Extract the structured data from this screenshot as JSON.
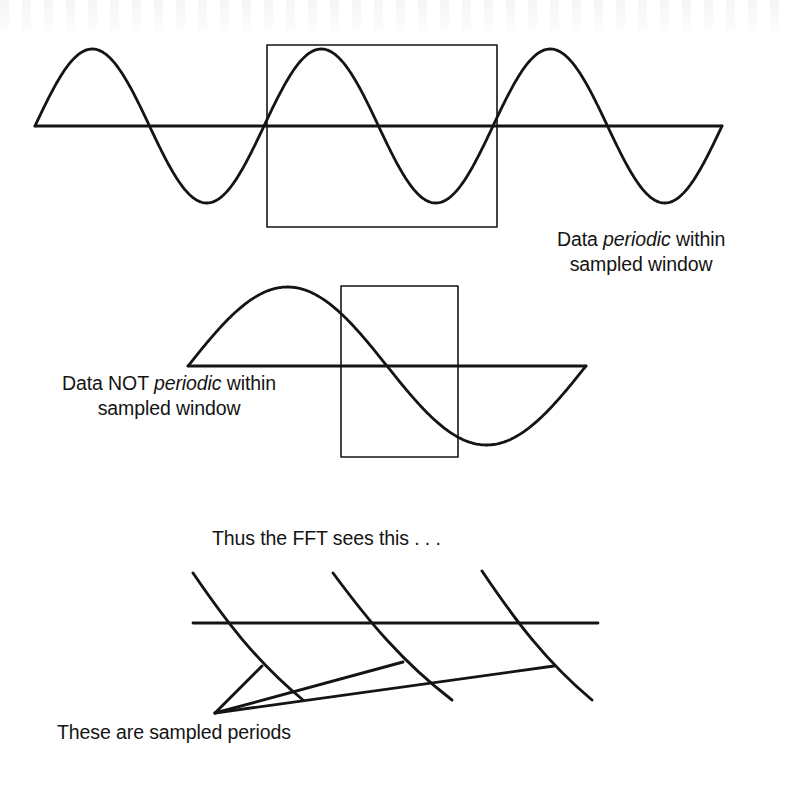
{
  "figure": {
    "kind": "line-diagram",
    "background_color": "#ffffff",
    "ink_color": "#141414",
    "width": 789,
    "height": 786
  },
  "captions": {
    "periodic": {
      "line1_prefix": "Data ",
      "line1_emphasis": "periodic",
      "line1_suffix": " within",
      "line2": "sampled window"
    },
    "not_periodic": {
      "line1_prefix": "Data NOT ",
      "line1_emphasis": "periodic",
      "line1_suffix": " within",
      "line2": "sampled window"
    },
    "thus": "Thus the FFT sees this . . .",
    "sampled_periods": "These are sampled periods"
  },
  "chart_data": {
    "type": "line",
    "title": "",
    "panels": [
      {
        "name": "periodic-panel",
        "description": "Sine wave with an integer number of cycles inside the sampling window",
        "baseline_y": 126,
        "wave": {
          "x_start": 35,
          "x_end": 722,
          "amplitude": 77,
          "period": 229,
          "cycles": 3,
          "phase": "sine-positive-first"
        },
        "window_rect": {
          "x": 267,
          "y": 45,
          "width": 230,
          "height": 182
        }
      },
      {
        "name": "not-periodic-panel",
        "description": "Sine wave with a non-integer number of cycles inside the sampling window",
        "baseline_y": 366,
        "wave": {
          "x_start": 188,
          "x_end": 586,
          "amplitude": 79,
          "period": 398,
          "cycles": 1,
          "phase": "sine-positive-first"
        },
        "window_rect": {
          "x": 341,
          "y": 286,
          "width": 117,
          "height": 171
        }
      },
      {
        "name": "fft-sees-this-panel",
        "description": "Discontinuous sawtooth-like waveform the FFT infers, with fan lines marking sampled periods",
        "baseline": {
          "x_start": 193,
          "x_end": 598,
          "y": 623
        },
        "segments": [
          {
            "x_start": 193,
            "y_start": 573,
            "x_end": 303,
            "y_end": 700
          },
          {
            "x_start": 333,
            "y_start": 573,
            "x_end": 452,
            "y_end": 700
          },
          {
            "x_start": 482,
            "y_start": 571,
            "x_end": 592,
            "y_end": 700
          }
        ],
        "fan_apex": {
          "x": 215,
          "y": 713
        },
        "fan_lines": [
          {
            "x_end": 262,
            "y_end": 666
          },
          {
            "x_end": 403,
            "y_end": 662
          },
          {
            "x_end": 554,
            "y_end": 666
          }
        ]
      }
    ],
    "xlabel": "",
    "ylabel": "",
    "grid": false,
    "legend": "none"
  }
}
